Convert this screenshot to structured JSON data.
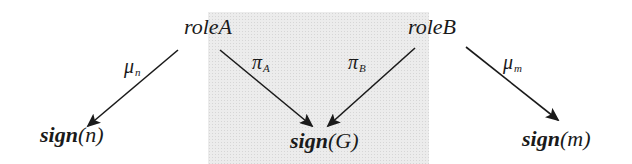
{
  "diagram": {
    "type": "commutative-style mapping diagram",
    "shaded_region": {
      "color": "#ececec",
      "x": 208,
      "y": 12,
      "width": 221,
      "height": 152
    },
    "nodes": {
      "roleA": {
        "label": "roleA",
        "x": 208,
        "y": 16
      },
      "roleB": {
        "label": "roleB",
        "x": 432,
        "y": 16
      },
      "sign_n": {
        "fn": "sign",
        "arg": "(n)",
        "x": 40,
        "y": 124
      },
      "sign_G": {
        "fn": "sign",
        "arg": "(G)",
        "x": 290,
        "y": 130
      },
      "sign_m": {
        "fn": "sign",
        "arg": "(m)",
        "x": 522,
        "y": 128
      }
    },
    "edges": [
      {
        "from": "roleA",
        "to": "sign_n",
        "label": "μ",
        "sub": "n",
        "x1": 178,
        "y1": 50,
        "x2": 88,
        "y2": 126
      },
      {
        "from": "roleA",
        "to": "sign_G",
        "label": "π",
        "sub": "A",
        "x1": 220,
        "y1": 50,
        "x2": 312,
        "y2": 126
      },
      {
        "from": "roleB",
        "to": "sign_G",
        "label": "π",
        "sub": "B",
        "x1": 415,
        "y1": 48,
        "x2": 328,
        "y2": 126
      },
      {
        "from": "roleB",
        "to": "sign_m",
        "label": "μ",
        "sub": "m",
        "x1": 466,
        "y1": 47,
        "x2": 558,
        "y2": 120
      }
    ],
    "edge_labels": {
      "mu_n": {
        "sym": "μ",
        "sub": "n",
        "x": 124,
        "y": 56
      },
      "pi_A": {
        "sym": "π",
        "sub": "A",
        "x": 252,
        "y": 52
      },
      "pi_B": {
        "sym": "π",
        "sub": "B",
        "x": 348,
        "y": 52
      },
      "mu_m": {
        "sym": "μ",
        "sub": "m",
        "x": 503,
        "y": 52
      }
    },
    "colors": {
      "ink": "#1a1a1a",
      "shade": "#ececec"
    }
  }
}
